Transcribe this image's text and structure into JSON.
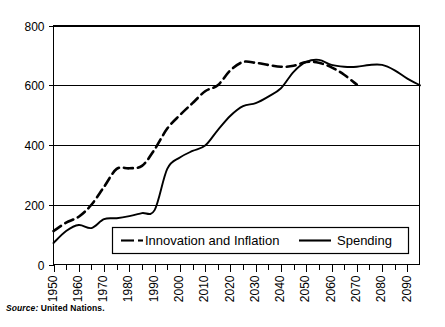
{
  "chart_data": {
    "type": "line",
    "title": "",
    "subtitle": "",
    "xlabel": "",
    "ylabel": "",
    "xlim": [
      1950,
      2095
    ],
    "ylim": [
      0,
      800
    ],
    "grid": true,
    "grid_axis": "y",
    "legend_position": "bottom-center",
    "y_ticks": [
      0,
      200,
      400,
      600,
      800
    ],
    "y_tick_labels": [
      "0",
      "200",
      "400",
      "600",
      "800"
    ],
    "x_ticks": [
      1950,
      1955,
      1960,
      1965,
      1970,
      1975,
      1980,
      1985,
      1990,
      1995,
      2000,
      2005,
      2010,
      2015,
      2020,
      2025,
      2030,
      2035,
      2040,
      2045,
      2050,
      2055,
      2060,
      2065,
      2070,
      2075,
      2080,
      2085,
      2090
    ],
    "x_tick_labels": [
      "1950",
      "1960",
      "1970",
      "1980",
      "1990",
      "2000",
      "2010",
      "2020",
      "2030",
      "2040",
      "2050",
      "2060",
      "2070",
      "2080",
      "2090"
    ],
    "x_tick_label_years": [
      1950,
      1960,
      1970,
      1980,
      1990,
      2000,
      2010,
      2020,
      2030,
      2040,
      2050,
      2060,
      2070,
      2080,
      2090
    ],
    "x_tick_label_rotation": -90,
    "series": [
      {
        "name": "Innovation and Inflation",
        "style": "dashed",
        "color": "#000000",
        "x": [
          1950,
          1955,
          1960,
          1965,
          1970,
          1975,
          1980,
          1985,
          1990,
          1995,
          2000,
          2005,
          2010,
          2015,
          2020,
          2025,
          2030,
          2035,
          2040,
          2045,
          2050,
          2055,
          2060,
          2065,
          2070
        ],
        "values": [
          112,
          140,
          160,
          200,
          260,
          320,
          322,
          330,
          385,
          455,
          500,
          540,
          580,
          600,
          650,
          678,
          675,
          668,
          662,
          665,
          678,
          675,
          660,
          635,
          602
        ]
      },
      {
        "name": "Spending",
        "style": "solid",
        "color": "#000000",
        "x": [
          1950,
          1955,
          1960,
          1965,
          1970,
          1975,
          1980,
          1985,
          1990,
          1995,
          2000,
          2005,
          2010,
          2015,
          2020,
          2025,
          2030,
          2035,
          2040,
          2045,
          2050,
          2055,
          2060,
          2065,
          2070,
          2075,
          2080,
          2085,
          2090,
          2095
        ],
        "values": [
          72,
          112,
          132,
          122,
          152,
          155,
          162,
          172,
          182,
          320,
          358,
          380,
          398,
          450,
          498,
          530,
          540,
          562,
          590,
          645,
          678,
          685,
          668,
          662,
          662,
          668,
          668,
          650,
          622,
          600
        ]
      }
    ]
  },
  "legend": {
    "items": [
      {
        "label": "Innovation and Inflation",
        "style": "dashed"
      },
      {
        "label": "Spending",
        "style": "solid"
      }
    ]
  },
  "source": {
    "label": "Source:",
    "text": "United Nations."
  }
}
